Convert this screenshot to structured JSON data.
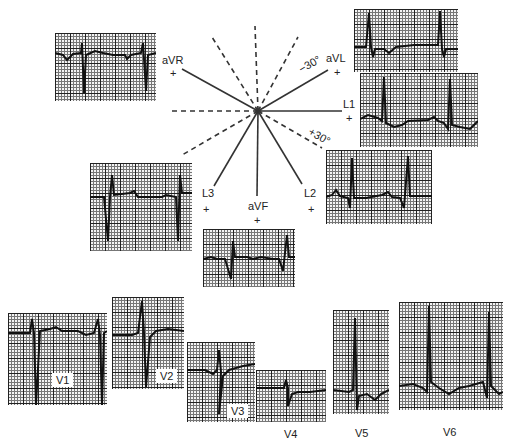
{
  "figure": {
    "hexaxial": {
      "center": [
        258,
        111
      ],
      "leads": [
        {
          "name": "L1",
          "label": "L1",
          "polarity": "+",
          "angle_deg": 0
        },
        {
          "name": "L2",
          "label": "L2",
          "polarity": "+",
          "angle_deg": 60
        },
        {
          "name": "aVF",
          "label": "aVF",
          "polarity": "+",
          "angle_deg": 90
        },
        {
          "name": "L3",
          "label": "L3",
          "polarity": "+",
          "angle_deg": 120
        },
        {
          "name": "aVR",
          "label": "aVR",
          "polarity": "+",
          "angle_deg": -150
        },
        {
          "name": "aVL",
          "label": "aVL",
          "polarity": "+",
          "angle_deg": -30
        }
      ],
      "angle_marks": [
        {
          "label": "−30°",
          "angle_deg": -30
        },
        {
          "label": "+30°",
          "angle_deg": 30
        }
      ]
    },
    "limb_strips": [
      {
        "lead": "aVR"
      },
      {
        "lead": "aVL"
      },
      {
        "lead": "L1"
      },
      {
        "lead": "L2"
      },
      {
        "lead": "L3"
      },
      {
        "lead": "aVF"
      }
    ],
    "precordial_strips": [
      {
        "lead": "V1",
        "label": "V1"
      },
      {
        "lead": "V2",
        "label": "V2"
      },
      {
        "lead": "V3",
        "label": "V3"
      },
      {
        "lead": "V4",
        "label": "V4"
      },
      {
        "lead": "V5",
        "label": "V5"
      },
      {
        "lead": "V6",
        "label": "V6"
      }
    ],
    "plus": "+"
  }
}
